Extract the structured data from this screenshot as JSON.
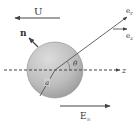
{
  "diagram": {
    "type": "physics-sphere-in-field",
    "labels": {
      "velocity": "U",
      "normal": "n",
      "unit_radial": "e",
      "unit_radial_sub": "r",
      "unit_axial": "e",
      "unit_axial_sub": "z",
      "axis": "z",
      "angle": "θ",
      "radius": "a",
      "field": "E",
      "field_sub": "∞"
    },
    "colors": {
      "line": "#444444",
      "sphere_light": "#d8d8d8",
      "sphere_dark": "#9a9a9a",
      "sphere_edge": "#888888",
      "background": "#ffffff"
    },
    "arrows": [
      {
        "name": "velocity-arrow",
        "direction": "left"
      },
      {
        "name": "normal-arrow",
        "direction": "up-left"
      },
      {
        "name": "radial-unit-vector",
        "direction": "up-right"
      },
      {
        "name": "axial-unit-vector",
        "direction": "right"
      },
      {
        "name": "field-arrow",
        "direction": "right"
      }
    ]
  }
}
